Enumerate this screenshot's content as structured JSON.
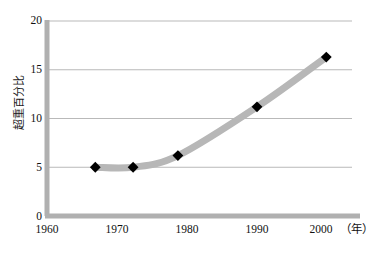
{
  "chart_data": {
    "type": "line",
    "title": "",
    "xlabel": "（年）",
    "ylabel": "超重百分比",
    "xlim": [
      1960,
      2004
    ],
    "ylim": [
      0,
      20
    ],
    "xticks": [
      1960,
      1970,
      1980,
      1990,
      2000
    ],
    "xtick_labels": [
      "1960",
      "1970",
      "1980",
      "1990",
      "2000"
    ],
    "yticks": [
      0,
      5,
      10,
      15,
      20
    ],
    "ytick_labels": [
      "0",
      "5",
      "10",
      "15",
      "20"
    ],
    "grid": "horizontal",
    "legend": "none",
    "series": [
      {
        "name": "超重百分比",
        "marker": "diamond",
        "marker_color": "#000000",
        "line_color": "#b7b7b7",
        "x": [
          1966.9,
          1972.3,
          1978.7,
          1990.0,
          1999.9
        ],
        "values": [
          5.0,
          5.0,
          6.2,
          11.2,
          16.3
        ],
        "points": [
          {
            "x": 1966.9,
            "y": 5.0
          },
          {
            "x": 1972.3,
            "y": 5.0
          },
          {
            "x": 1978.7,
            "y": 6.2
          },
          {
            "x": 1990.0,
            "y": 11.2
          },
          {
            "x": 1999.9,
            "y": 16.3
          }
        ]
      }
    ]
  },
  "axis": {
    "y_label_text": "超重百分比",
    "x_unit_text": "（年）",
    "y_ticks": [
      {
        "label": "20"
      },
      {
        "label": "15"
      },
      {
        "label": "10"
      },
      {
        "label": "5"
      },
      {
        "label": "0"
      }
    ],
    "x_ticks": [
      {
        "label": "1960"
      },
      {
        "label": "1970"
      },
      {
        "label": "1980"
      },
      {
        "label": "1990"
      },
      {
        "label": "2000"
      }
    ]
  },
  "colors": {
    "curve": "#b7b7b7",
    "axis": "#b0b0b0",
    "gridline": "#b9b9b9",
    "marker": "#000000",
    "text": "#111111",
    "background": "#ffffff"
  }
}
